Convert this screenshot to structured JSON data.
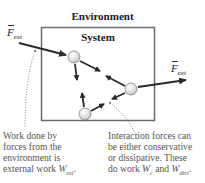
{
  "diagram": {
    "environment_label": "Environment",
    "system_label": "System",
    "external_force_left": {
      "symbol": "F",
      "subscript": "ext"
    },
    "external_force_right": {
      "symbol": "F",
      "subscript": "ext"
    },
    "particles": [
      {
        "id": "p1",
        "x": 74,
        "y": 57
      },
      {
        "id": "p2",
        "x": 131,
        "y": 89
      },
      {
        "id": "p3",
        "x": 85,
        "y": 114
      }
    ],
    "caption_left": {
      "lines": [
        "Work done by",
        "forces from the",
        "environment is"
      ],
      "last_line_text": "external work ",
      "symbol": "W",
      "subscript": "ext",
      "end": "."
    },
    "caption_right": {
      "lines": [
        "Interaction forces can",
        "be either conservative",
        "or dissipative. These"
      ],
      "last_line_text": "do work ",
      "symbol_1": "W",
      "subscript_1": "c",
      "joiner": " and ",
      "symbol_2": "W",
      "subscript_2": "diss",
      "end": "."
    },
    "colors": {
      "box": "#6b6b6b",
      "arrow": "#2b2b2b",
      "particle_fill": "#e4e4e4",
      "particle_stroke": "#888888",
      "dotted": "#8a8a8a",
      "caption_text": "#555555"
    }
  }
}
